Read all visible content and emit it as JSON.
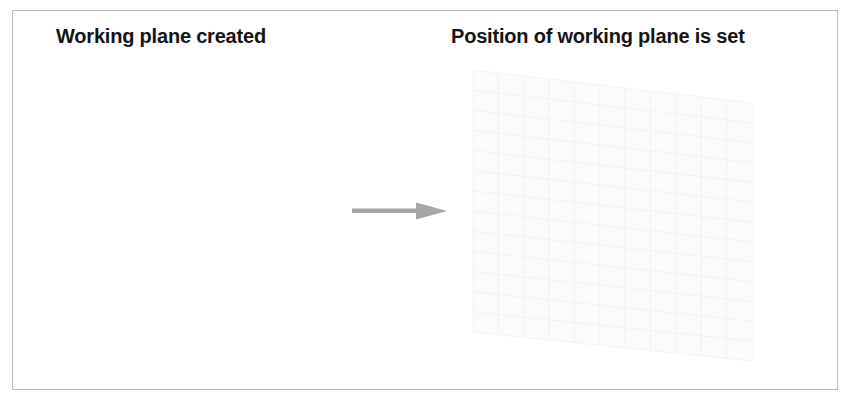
{
  "figure": {
    "background_color": "#ffffff",
    "border_color": "#a9a9a9",
    "width": 850,
    "height": 404
  },
  "panels": {
    "left": {
      "caption": "Working plane created",
      "content_description": "empty white area"
    },
    "right": {
      "caption": "Position of working plane is set",
      "content_description": "faint grey perspective grid of the working plane"
    }
  },
  "arrow": {
    "name": "transition-arrow",
    "direction": "right",
    "color": "#a6a6a6"
  },
  "plane": {
    "name": "working-plane",
    "stroke_color": "#f2f2f2",
    "fill_color": "#fbfbfb",
    "columns": 11,
    "rows": 13,
    "corners": {
      "top_left": [
        18,
        15
      ],
      "top_right": [
        297,
        48
      ],
      "bottom_right": [
        297,
        306
      ],
      "bottom_left": [
        18,
        277
      ]
    }
  }
}
